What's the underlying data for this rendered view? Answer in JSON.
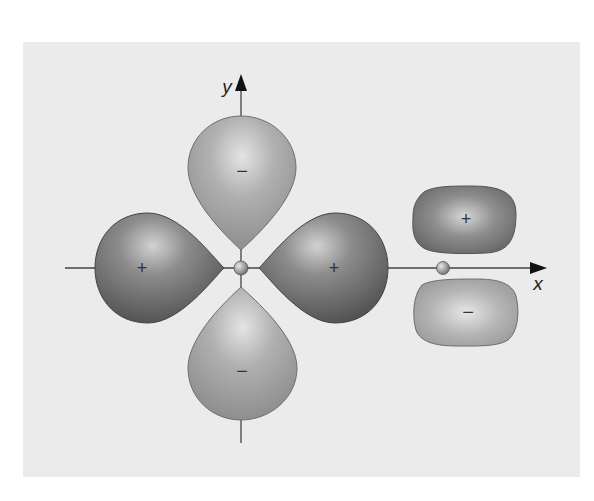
{
  "diagram": {
    "type": "orbital-overlap",
    "axes": {
      "x_label": "x",
      "y_label": "y"
    },
    "d_orbital": {
      "lobes": [
        {
          "position": "top",
          "sign": "−",
          "phase": "negative"
        },
        {
          "position": "left",
          "sign": "+",
          "phase": "positive"
        },
        {
          "position": "right",
          "sign": "+",
          "phase": "positive"
        },
        {
          "position": "bottom",
          "sign": "−",
          "phase": "negative"
        }
      ]
    },
    "p_orbital": {
      "lobes": [
        {
          "position": "top",
          "sign": "+",
          "phase": "positive"
        },
        {
          "position": "bottom",
          "sign": "−",
          "phase": "negative"
        }
      ]
    },
    "colors": {
      "background": "#ebebeb",
      "positive_lobe": "#7a7a7a",
      "negative_lobe": "#a9a9a9",
      "axis": "#444444",
      "nucleus": "#9a9a9a"
    }
  }
}
